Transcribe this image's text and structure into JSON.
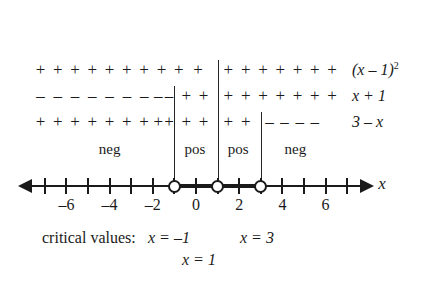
{
  "chart_data": {
    "type": "table",
    "xlabel": "x",
    "axis": {
      "variable": "x",
      "min": -7.5,
      "max": 7.5,
      "tick_step": 1,
      "labeled_ticks": [
        -6,
        -4,
        -2,
        0,
        2,
        4,
        6
      ],
      "labeled_tick_text": [
        "–6",
        "–4",
        "–2",
        "0",
        "2",
        "4",
        "6"
      ],
      "left_arrow": true,
      "right_arrow": true,
      "open_points": [
        -1,
        1,
        3
      ],
      "highlighted_intervals": [
        [
          -1,
          1
        ],
        [
          1,
          3
        ]
      ]
    },
    "critical_values": [
      -1,
      1,
      3
    ],
    "factors": [
      {
        "name": "(x - 1) squared",
        "label_plain": "(x – 1)²",
        "breakpoints": [
          1
        ],
        "segments": [
          {
            "from": -7.5,
            "to": 1,
            "sign": "+",
            "count": 10
          },
          {
            "from": 1,
            "to": 7.5,
            "sign": "+",
            "count": 7
          }
        ]
      },
      {
        "name": "x + 1",
        "label_plain": "x + 1",
        "breakpoints": [
          -1,
          1
        ],
        "segments": [
          {
            "from": -7.5,
            "to": -1,
            "sign": "–",
            "count": 9
          },
          {
            "from": -1,
            "to": 1,
            "sign": "+",
            "count": 2
          },
          {
            "from": 1,
            "to": 7.5,
            "sign": "+",
            "count": 7
          }
        ]
      },
      {
        "name": "3 - x",
        "label_plain": "3 – x",
        "breakpoints": [
          -1,
          1,
          3
        ],
        "segments": [
          {
            "from": -7.5,
            "to": -1,
            "sign": "+",
            "count": 9
          },
          {
            "from": -1,
            "to": 1,
            "sign": "+",
            "count": 2
          },
          {
            "from": 1,
            "to": 3,
            "sign": "+",
            "count": 2
          },
          {
            "from": 3,
            "to": 7.5,
            "sign": "–",
            "count": 4
          }
        ]
      }
    ],
    "interval_results": [
      {
        "interval": [
          -7.5,
          -1
        ],
        "label": "neg"
      },
      {
        "interval": [
          -1,
          1
        ],
        "label": "pos"
      },
      {
        "interval": [
          1,
          3
        ],
        "label": "pos"
      },
      {
        "interval": [
          3,
          7.5
        ],
        "label": "neg"
      }
    ]
  },
  "rows": [
    {
      "id": "row-x-minus-1-squared",
      "factor_base": "(x – 1)",
      "factor_exponent": "2",
      "signs": [
        {
          "sign": "+",
          "positions": [
            -7.2,
            -6.4,
            -5.6,
            -4.8,
            -4.0,
            -3.2,
            -2.4,
            -1.6,
            -0.8,
            0.1
          ]
        },
        {
          "sign": "+",
          "positions": [
            1.5,
            2.3,
            3.1,
            3.9,
            4.7,
            5.5,
            6.3
          ]
        }
      ]
    },
    {
      "id": "row-x-plus-1",
      "factor_text": "x + 1",
      "signs": [
        {
          "sign": "–",
          "positions": [
            -7.2,
            -6.4,
            -5.6,
            -4.8,
            -4.0,
            -3.2,
            -2.4,
            -1.75,
            -1.25
          ]
        },
        {
          "sign": "+",
          "positions": [
            -0.45,
            0.35
          ]
        },
        {
          "sign": "+",
          "positions": [
            1.5,
            2.3,
            3.1,
            3.9,
            4.7,
            5.5,
            6.3
          ]
        }
      ]
    },
    {
      "id": "row-3-minus-x",
      "factor_text": "3 – x",
      "signs": [
        {
          "sign": "+",
          "positions": [
            -7.2,
            -6.4,
            -5.6,
            -4.8,
            -4.0,
            -3.2,
            -2.4,
            -1.75,
            -1.25
          ]
        },
        {
          "sign": "+",
          "positions": [
            -0.45,
            0.35
          ]
        },
        {
          "sign": "+",
          "positions": [
            1.5,
            2.3
          ]
        },
        {
          "sign": "–",
          "positions": [
            3.4,
            4.1,
            4.8,
            5.5
          ]
        }
      ]
    }
  ],
  "interval_labels": [
    {
      "id": "interval-label-neg-left",
      "text": "neg",
      "center": -4.0
    },
    {
      "id": "interval-label-pos-1",
      "text": "pos",
      "center": -0.05
    },
    {
      "id": "interval-label-pos-2",
      "text": "pos",
      "center": 1.95
    },
    {
      "id": "interval-label-neg-right",
      "text": "neg",
      "center": 4.6
    }
  ],
  "axis_ticks": [
    {
      "value": -7,
      "label": ""
    },
    {
      "value": -6,
      "label": "–6"
    },
    {
      "value": -5,
      "label": ""
    },
    {
      "value": -4,
      "label": "–4"
    },
    {
      "value": -3,
      "label": ""
    },
    {
      "value": -2,
      "label": "–2"
    },
    {
      "value": -1,
      "label": ""
    },
    {
      "value": 0,
      "label": "0"
    },
    {
      "value": 1,
      "label": ""
    },
    {
      "value": 2,
      "label": "2"
    },
    {
      "value": 3,
      "label": ""
    },
    {
      "value": 4,
      "label": "4"
    },
    {
      "value": 5,
      "label": ""
    },
    {
      "value": 6,
      "label": "6"
    },
    {
      "value": 7,
      "label": ""
    }
  ],
  "axis_variable": "x",
  "dividers": [
    {
      "id": "divider-at-neg-1",
      "value": -1,
      "top": 86,
      "bottom": 186
    },
    {
      "id": "divider-at-1",
      "value": 1,
      "top": 60,
      "bottom": 186
    },
    {
      "id": "divider-at-3",
      "value": 3,
      "top": 112,
      "bottom": 186
    }
  ],
  "critical_values_section": {
    "prefix": "critical values:",
    "entries": [
      {
        "id": "critical-value-neg-1",
        "text": "x = –1",
        "x_px": 148,
        "y_px": 228
      },
      {
        "id": "critical-value-3",
        "text": "x = 3",
        "x_px": 240,
        "y_px": 228
      },
      {
        "id": "critical-value-1",
        "text": "x = 1",
        "x_px": 182,
        "y_px": 250
      }
    ]
  },
  "colors": {
    "ink": "#1a1a1a",
    "rule": "#262626",
    "background": "#ffffff"
  }
}
